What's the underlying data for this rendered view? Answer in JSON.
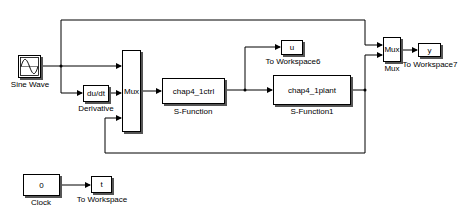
{
  "model": {
    "blocks": {
      "sine": {
        "label": "Sine Wave"
      },
      "derivative": {
        "text": "du/dt",
        "label": "Derivative"
      },
      "mux1": {
        "text": "Mux"
      },
      "ctrl": {
        "text": "chap4_1ctrl",
        "label": "S-Function"
      },
      "plant": {
        "text": "chap4_1plant",
        "label": "S-Function1"
      },
      "u_ws": {
        "text": "u",
        "label": "To Workspace6"
      },
      "mux2": {
        "text": "Mux",
        "label": "Mux"
      },
      "y_ws": {
        "text": "y",
        "label": "To Workspace7"
      },
      "clock": {
        "text": "0",
        "label": "Clock"
      },
      "t_ws": {
        "text": "t",
        "label": "To Workspace"
      }
    }
  }
}
